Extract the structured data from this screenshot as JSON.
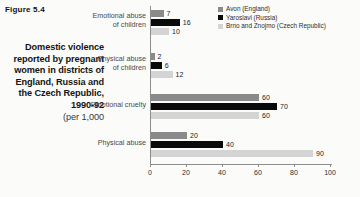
{
  "figure_label": "Figure 5.4",
  "caption": {
    "main": "Domestic violence reported by pregnant women in districts of England, Russia and the Czech Republic, 1990-92",
    "sub": "(per 1,000"
  },
  "legend": {
    "items": [
      {
        "label": "Avon (England)",
        "color": "#8a8a8a"
      },
      {
        "label": "Yaroslavl (Russia)",
        "color": "#0a0a0a"
      },
      {
        "label": "Brno and Znojmo (Czech Republic)",
        "color": "#d4d4d4"
      }
    ]
  },
  "chart_data": {
    "type": "bar",
    "orientation": "horizontal",
    "title": "Domestic violence reported by pregnant women in districts of England, Russia and the Czech Republic, 1990-92",
    "xlabel": "",
    "ylabel": "",
    "xlim": [
      0,
      100
    ],
    "xticks": [
      0,
      20,
      40,
      60,
      80,
      100
    ],
    "grid": false,
    "legend_position": "top-right",
    "categories": [
      "Emotional abuse\nof children",
      "Physical abuse\nof children",
      "Emotional cruelty",
      "Physical abuse"
    ],
    "series": [
      {
        "name": "Avon (England)",
        "color": "#8a8a8a",
        "values": [
          7,
          2,
          60,
          20
        ]
      },
      {
        "name": "Yaroslavl (Russia)",
        "color": "#0a0a0a",
        "values": [
          16,
          6,
          70,
          40
        ]
      },
      {
        "name": "Brno and Znojmo (Czech Republic)",
        "color": "#d4d4d4",
        "values": [
          10,
          12,
          60,
          90
        ]
      }
    ]
  }
}
